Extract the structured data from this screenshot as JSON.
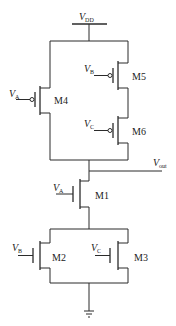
{
  "diagram": {
    "type": "CMOS logic gate schematic",
    "supply": {
      "label_main": "V",
      "label_sub": "DD"
    },
    "output": {
      "label_main": "V",
      "label_sub": "out"
    },
    "ground": {
      "symbol": "ground-icon"
    },
    "transistors": [
      {
        "name": "M4",
        "type": "PMOS",
        "gate_main": "V",
        "gate_sub": "A"
      },
      {
        "name": "M5",
        "type": "PMOS",
        "gate_main": "V",
        "gate_sub": "B"
      },
      {
        "name": "M6",
        "type": "PMOS",
        "gate_main": "V",
        "gate_sub": "C"
      },
      {
        "name": "M1",
        "type": "NMOS",
        "gate_main": "V",
        "gate_sub": "A"
      },
      {
        "name": "M2",
        "type": "NMOS",
        "gate_main": "V",
        "gate_sub": "B"
      },
      {
        "name": "M3",
        "type": "NMOS",
        "gate_main": "V",
        "gate_sub": "C"
      }
    ]
  }
}
